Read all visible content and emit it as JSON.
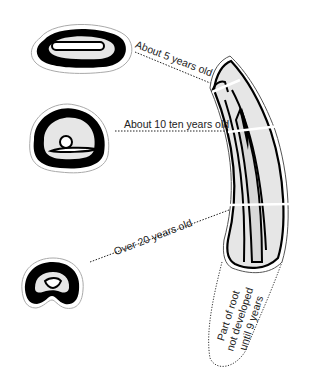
{
  "diagram": {
    "colors": {
      "ink": "#000000",
      "fill": "#e6e6e6",
      "canal": "#ffffff",
      "outline": "#999999"
    },
    "labels": {
      "age_5": "About 5 years old",
      "age_10": "About 10 ten years old",
      "age_20": "Over 20 years old"
    },
    "root_note": {
      "line1": "Part of root",
      "line2": "not developed",
      "line3": "until 9 years"
    },
    "cross_sections": [
      {
        "name": "cross-section-5-years",
        "age": "About 5 years old"
      },
      {
        "name": "cross-section-10-years",
        "age": "About 10 ten years old"
      },
      {
        "name": "cross-section-20-years",
        "age": "Over 20 years old"
      }
    ]
  }
}
